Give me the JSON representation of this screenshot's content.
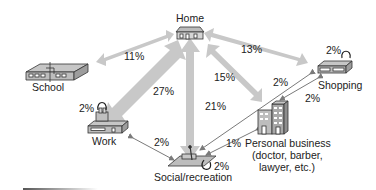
{
  "diagram": {
    "type": "trip-distribution",
    "colors": {
      "thick_arrow": "#c8c8c8",
      "thin_arrow": "#7a7a7a",
      "building_fill": "#b5b5b5",
      "building_stroke": "#333333",
      "text": "#222222"
    },
    "nodes": {
      "home": {
        "label": "Home"
      },
      "school": {
        "label": "School"
      },
      "work": {
        "label": "Work",
        "self_loop": "2%"
      },
      "shopping": {
        "label": "Shopping",
        "self_loop": "2%"
      },
      "social": {
        "label": "Social/recreation",
        "self_loop": "2%"
      },
      "personal": {
        "label_line1": "Personal business",
        "label_line2": "(doctor, barber,",
        "label_line3": "lawyer, etc.)"
      }
    },
    "edges": {
      "home_school": "11%",
      "home_shopping": "13%",
      "home_work": "27%",
      "home_personal": "15%",
      "home_social": "21%",
      "work_social": "2%",
      "shopping_social": "2%",
      "shopping_personal": "2%",
      "personal_social": "1%"
    }
  }
}
